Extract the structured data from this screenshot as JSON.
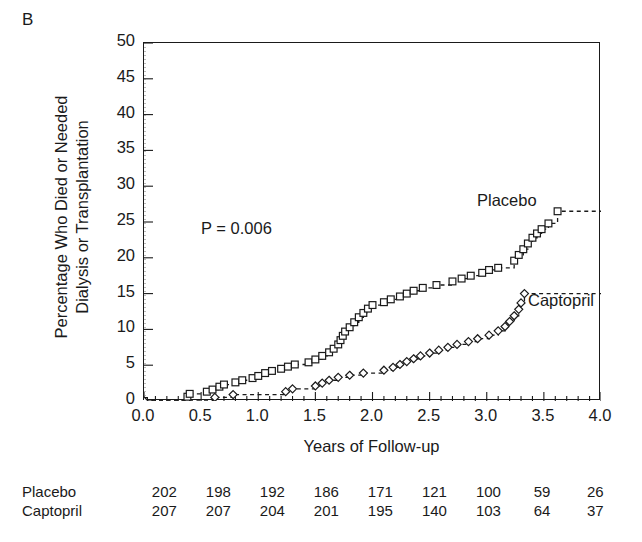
{
  "panel": {
    "label": "B"
  },
  "axes": {
    "ylabel_line1": "Percentage Who Died or Needed",
    "ylabel_line2": "Dialysis or Transplantation",
    "xlabel": "Years of Follow-up",
    "yticks": [
      0,
      5,
      10,
      15,
      20,
      25,
      30,
      35,
      40,
      45,
      50
    ],
    "xticks": [
      "0.0",
      "0.5",
      "1.0",
      "1.5",
      "2.0",
      "2.5",
      "3.0",
      "3.5",
      "4.0"
    ]
  },
  "annotations": {
    "pvalue": "P = 0.006",
    "placebo": "Placebo",
    "captopril": "Captopril"
  },
  "risk_table": {
    "rows": [
      {
        "name": "Placebo",
        "values": [
          "202",
          "198",
          "192",
          "186",
          "171",
          "121",
          "100",
          "59",
          "26"
        ]
      },
      {
        "name": "Captopril",
        "values": [
          "207",
          "207",
          "204",
          "201",
          "195",
          "140",
          "103",
          "64",
          "37"
        ]
      }
    ]
  },
  "chart_data": {
    "type": "line",
    "title": "B",
    "xlabel": "Years of Follow-up",
    "ylabel": "Percentage Who Died or Needed Dialysis or Transplantation",
    "xlim": [
      0.0,
      4.0
    ],
    "ylim": [
      0,
      50
    ],
    "xticks": [
      0.0,
      0.5,
      1.0,
      1.5,
      2.0,
      2.5,
      3.0,
      3.5,
      4.0
    ],
    "yticks": [
      0,
      5,
      10,
      15,
      20,
      25,
      30,
      35,
      40,
      45,
      50
    ],
    "grid": false,
    "legend_position": "inline-annotation",
    "annotation": "P = 0.006",
    "series": [
      {
        "name": "Placebo",
        "marker": "open-square",
        "linestyle": "dashed",
        "final_value": 26.5,
        "points": [
          [
            0.0,
            0.0
          ],
          [
            0.38,
            0.6
          ],
          [
            0.4,
            1.0
          ],
          [
            0.55,
            1.3
          ],
          [
            0.6,
            1.6
          ],
          [
            0.66,
            2.0
          ],
          [
            0.7,
            2.3
          ],
          [
            0.8,
            2.6
          ],
          [
            0.86,
            2.9
          ],
          [
            0.95,
            3.2
          ],
          [
            1.0,
            3.5
          ],
          [
            1.06,
            3.9
          ],
          [
            1.12,
            4.2
          ],
          [
            1.2,
            4.5
          ],
          [
            1.26,
            4.8
          ],
          [
            1.32,
            5.1
          ],
          [
            1.44,
            5.4
          ],
          [
            1.5,
            5.8
          ],
          [
            1.56,
            6.3
          ],
          [
            1.62,
            6.8
          ],
          [
            1.66,
            7.3
          ],
          [
            1.7,
            7.9
          ],
          [
            1.72,
            8.5
          ],
          [
            1.74,
            9.1
          ],
          [
            1.76,
            9.7
          ],
          [
            1.8,
            10.3
          ],
          [
            1.84,
            11.0
          ],
          [
            1.88,
            11.7
          ],
          [
            1.92,
            12.3
          ],
          [
            1.96,
            12.9
          ],
          [
            2.0,
            13.4
          ],
          [
            2.1,
            13.8
          ],
          [
            2.16,
            14.2
          ],
          [
            2.24,
            14.6
          ],
          [
            2.3,
            15.0
          ],
          [
            2.36,
            15.4
          ],
          [
            2.44,
            15.8
          ],
          [
            2.56,
            16.2
          ],
          [
            2.7,
            16.7
          ],
          [
            2.78,
            17.1
          ],
          [
            2.86,
            17.5
          ],
          [
            2.96,
            17.9
          ],
          [
            3.02,
            18.3
          ],
          [
            3.1,
            18.6
          ],
          [
            3.24,
            19.6
          ],
          [
            3.28,
            20.4
          ],
          [
            3.32,
            21.2
          ],
          [
            3.36,
            22.0
          ],
          [
            3.4,
            22.8
          ],
          [
            3.44,
            23.4
          ],
          [
            3.48,
            24.0
          ],
          [
            3.54,
            24.8
          ],
          [
            3.62,
            26.5
          ],
          [
            4.0,
            26.5
          ]
        ]
      },
      {
        "name": "Captopril",
        "marker": "open-diamond",
        "linestyle": "dashed",
        "final_value": 15.0,
        "points": [
          [
            0.0,
            0.0
          ],
          [
            0.62,
            0.5
          ],
          [
            0.78,
            0.9
          ],
          [
            1.24,
            1.3
          ],
          [
            1.3,
            1.7
          ],
          [
            1.5,
            2.1
          ],
          [
            1.56,
            2.5
          ],
          [
            1.62,
            2.9
          ],
          [
            1.7,
            3.3
          ],
          [
            1.8,
            3.6
          ],
          [
            1.92,
            3.9
          ],
          [
            2.1,
            4.3
          ],
          [
            2.18,
            4.7
          ],
          [
            2.24,
            5.1
          ],
          [
            2.3,
            5.5
          ],
          [
            2.36,
            5.9
          ],
          [
            2.42,
            6.3
          ],
          [
            2.5,
            6.7
          ],
          [
            2.58,
            7.1
          ],
          [
            2.66,
            7.5
          ],
          [
            2.74,
            7.9
          ],
          [
            2.84,
            8.3
          ],
          [
            2.92,
            8.7
          ],
          [
            3.02,
            9.2
          ],
          [
            3.1,
            9.8
          ],
          [
            3.16,
            10.4
          ],
          [
            3.2,
            11.1
          ],
          [
            3.24,
            11.9
          ],
          [
            3.28,
            12.8
          ],
          [
            3.3,
            13.7
          ],
          [
            3.33,
            15.0
          ],
          [
            4.0,
            15.0
          ]
        ]
      }
    ]
  }
}
